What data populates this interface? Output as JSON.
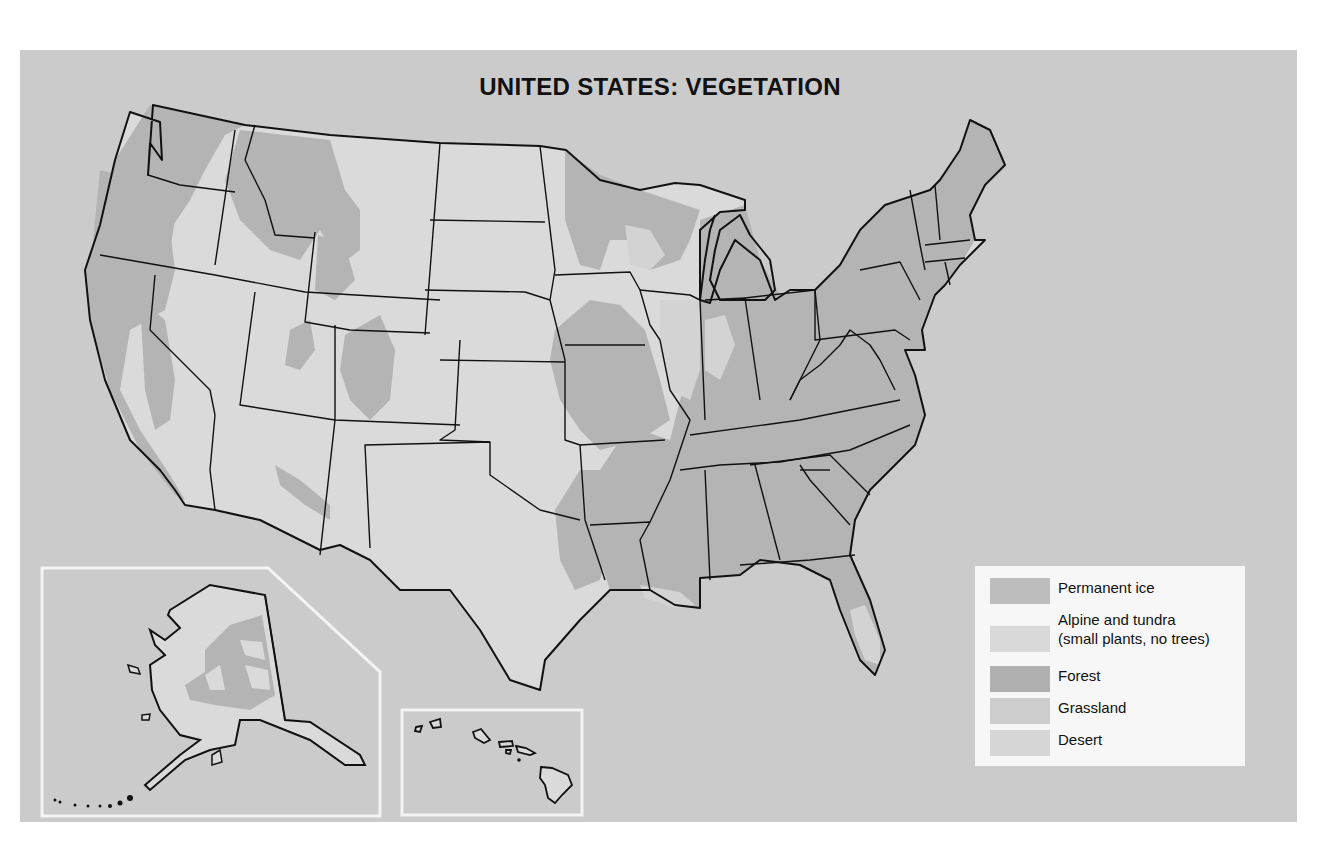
{
  "title": "UNITED STATES: VEGETATION",
  "colors": {
    "background_panel": "#cbcbcb",
    "land_base": "#dadada",
    "permanent_ice": "#bdbdbd",
    "alpine_tundra": "#d9d9d9",
    "forest": "#b4b4b4",
    "grassland": "#cfcfcf",
    "desert": "#d8d8d8",
    "border": "#111111",
    "inset_frame": "#f4f4f4"
  },
  "legend": {
    "items": [
      {
        "key": "permanent_ice",
        "label": "Permanent ice",
        "color": "#bdbdbd"
      },
      {
        "key": "alpine_tundra",
        "label": "Alpine and tundra\n(small plants, no trees)",
        "color": "#d9d9d9"
      },
      {
        "key": "forest",
        "label": "Forest",
        "color": "#b0b0b0"
      },
      {
        "key": "grassland",
        "label": "Grassland",
        "color": "#cdcdcd"
      },
      {
        "key": "desert",
        "label": "Desert",
        "color": "#d6d6d6"
      }
    ]
  },
  "insets": [
    {
      "name": "Alaska"
    },
    {
      "name": "Hawaii"
    }
  ]
}
